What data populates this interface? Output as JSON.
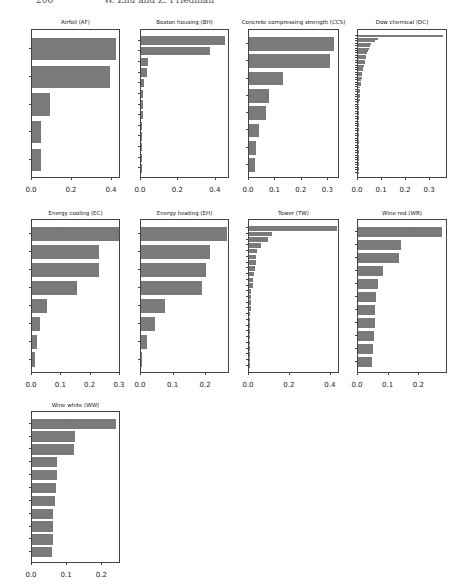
{
  "page_header": {
    "page_number": "206",
    "running_title": "W. Zhu and Z. Friedman"
  },
  "style": {
    "bar_color": "#7a7a7a",
    "axis_color": "#444444"
  },
  "chart_data": [
    {
      "id": "af",
      "type": "bar",
      "orientation": "horizontal",
      "title": "Airfoil (AF)",
      "categories": [
        "X5",
        "X1",
        "X3",
        "X4",
        "X2"
      ],
      "values": [
        0.42,
        0.39,
        0.09,
        0.045,
        0.043
      ],
      "xticks": [
        "0.0",
        "0.2",
        "0.4"
      ],
      "xlim": [
        0,
        0.44
      ]
    },
    {
      "id": "bh",
      "type": "bar",
      "orientation": "horizontal",
      "title": "Boston housing (BH)",
      "categories": [
        "X13",
        "X6",
        "X1",
        "X8",
        "X10",
        "X12",
        "X7",
        "X11",
        "X5",
        "X3",
        "X9",
        "X2",
        "X4"
      ],
      "values": [
        0.45,
        0.37,
        0.04,
        0.03,
        0.015,
        0.013,
        0.012,
        0.01,
        0.008,
        0.006,
        0.004,
        0.003,
        0.002
      ],
      "xticks": [
        "0.0",
        "0.2",
        "0.4"
      ],
      "xlim": [
        0,
        0.47
      ]
    },
    {
      "id": "ccs",
      "type": "bar",
      "orientation": "horizontal",
      "title": "Concrete compressing strength (CCS)",
      "categories": [
        "X8",
        "X1",
        "X4",
        "X5",
        "X2",
        "X7",
        "X6",
        "X3"
      ],
      "values": [
        0.32,
        0.305,
        0.13,
        0.075,
        0.065,
        0.037,
        0.028,
        0.023
      ],
      "xticks": [
        "0.0",
        "0.1",
        "0.2",
        "0.3"
      ],
      "xlim": [
        0,
        0.34
      ]
    },
    {
      "id": "dc",
      "type": "bar",
      "orientation": "horizontal",
      "title": "Dow chemical (DC)",
      "categories": [
        "X1",
        "X2",
        "X3",
        "X4",
        "X5",
        "X6",
        "X7",
        "X8",
        "X9",
        "X10",
        "X11",
        "X12",
        "X13",
        "X14",
        "X15",
        "X16",
        "X17",
        "X18",
        "X19",
        "X20",
        "X21",
        "X22",
        "X23",
        "X24",
        "X25",
        "X26",
        "X27",
        "X28",
        "X29",
        "X30",
        "X31",
        "X32",
        "X33",
        "X34",
        "X35",
        "X36",
        "X37",
        "X38",
        "X39",
        "X40",
        "X41",
        "X42",
        "X43",
        "X44",
        "X45",
        "X46",
        "X47",
        "X48",
        "X49",
        "X50",
        "X51",
        "X52",
        "X53",
        "X54",
        "X55",
        "X56",
        "X57"
      ],
      "values": [
        0.355,
        0.085,
        0.07,
        0.055,
        0.05,
        0.045,
        0.04,
        0.038,
        0.035,
        0.032,
        0.03,
        0.028,
        0.025,
        0.022,
        0.02,
        0.018,
        0.016,
        0.015,
        0.013,
        0.012,
        0.011,
        0.01,
        0.009,
        0.008,
        0.008,
        0.007,
        0.007,
        0.006,
        0.006,
        0.005,
        0.005,
        0.005,
        0.004,
        0.004,
        0.004,
        0.003,
        0.003,
        0.003,
        0.003,
        0.002,
        0.002,
        0.002,
        0.002,
        0.002,
        0.002,
        0.001,
        0.001,
        0.001,
        0.001,
        0.001,
        0.001,
        0.001,
        0.001,
        0.001,
        0.001,
        0.001,
        0.001
      ],
      "xticks": [
        "0.0",
        "0.1",
        "0.2",
        "0.3"
      ],
      "xlim": [
        0,
        0.37
      ]
    },
    {
      "id": "ec",
      "type": "bar",
      "orientation": "horizontal",
      "title": "Energy cooling (EC)",
      "categories": [
        "X1",
        "X4",
        "X5",
        "X2",
        "X7",
        "X3",
        "X8",
        "X6"
      ],
      "values": [
        0.295,
        0.23,
        0.228,
        0.155,
        0.05,
        0.028,
        0.018,
        0.01
      ],
      "xticks": [
        "0.0",
        "0.1",
        "0.2",
        "0.3"
      ],
      "xlim": [
        0,
        0.3
      ]
    },
    {
      "id": "eh",
      "type": "bar",
      "orientation": "horizontal",
      "title": "Energy heating (EH)",
      "categories": [
        "X2",
        "X5",
        "X1",
        "X4",
        "X7",
        "X3",
        "X8",
        "X6"
      ],
      "values": [
        0.265,
        0.213,
        0.198,
        0.188,
        0.073,
        0.042,
        0.018,
        0.001
      ],
      "xticks": [
        "0.0",
        "0.1",
        "0.2"
      ],
      "xlim": [
        0,
        0.27
      ]
    },
    {
      "id": "tw",
      "type": "bar",
      "orientation": "horizontal",
      "title": "Tower (TW)",
      "categories": [
        "X6",
        "X1",
        "X2",
        "X8",
        "X17",
        "X23",
        "X20",
        "X22",
        "X24",
        "X13",
        "X12",
        "X9",
        "X16",
        "X10",
        "X3",
        "X4",
        "X11",
        "X7",
        "X21",
        "X15",
        "X14",
        "X25",
        "X19",
        "X5",
        "X18"
      ],
      "values": [
        0.43,
        0.11,
        0.095,
        0.06,
        0.04,
        0.035,
        0.035,
        0.03,
        0.025,
        0.02,
        0.018,
        0.012,
        0.01,
        0.01,
        0.008,
        0.007,
        0.005,
        0.004,
        0.003,
        0.003,
        0.002,
        0.002,
        0.002,
        0.001,
        0.001
      ],
      "xticks": [
        "0.0",
        "0.2",
        "0.4"
      ],
      "xlim": [
        0,
        0.44
      ]
    },
    {
      "id": "wr",
      "type": "bar",
      "orientation": "horizontal",
      "title": "Wine red (WR)",
      "categories": [
        "X11",
        "X2",
        "X10",
        "X7",
        "X1",
        "X9",
        "X5",
        "X8",
        "X4",
        "X3",
        "X6"
      ],
      "values": [
        0.275,
        0.14,
        0.132,
        0.08,
        0.066,
        0.058,
        0.057,
        0.054,
        0.053,
        0.048,
        0.045
      ],
      "xticks": [
        "0.0",
        "0.1",
        "0.2"
      ],
      "xlim": [
        0,
        0.29
      ]
    },
    {
      "id": "ww",
      "type": "bar",
      "orientation": "horizontal",
      "title": "Wine white (WW)",
      "categories": [
        "X11",
        "X8",
        "X2",
        "X7",
        "X1",
        "X6",
        "X5",
        "X3",
        "X10",
        "X4",
        "X9"
      ],
      "values": [
        0.24,
        0.122,
        0.118,
        0.071,
        0.07,
        0.069,
        0.066,
        0.061,
        0.06,
        0.06,
        0.058
      ],
      "xticks": [
        "0.0",
        "0.1",
        "0.2"
      ],
      "xlim": [
        0,
        0.25
      ]
    }
  ],
  "layout": [
    {
      "title_y": 19,
      "ax": [
        31,
        29,
        89,
        149
      ],
      "xlab_y": 186
    },
    {
      "title_y": 19,
      "ax": [
        140,
        29,
        89,
        149
      ],
      "xlab_y": 186
    },
    {
      "title_y": 19,
      "ax": [
        248,
        29,
        91,
        149
      ],
      "xlab_y": 186
    },
    {
      "title_y": 19,
      "ax": [
        357,
        29,
        90,
        149
      ],
      "xlab_y": 186
    },
    {
      "title_y": 210,
      "ax": [
        31,
        219,
        89,
        154
      ],
      "xlab_y": 381
    },
    {
      "title_y": 210,
      "ax": [
        140,
        219,
        89,
        154
      ],
      "xlab_y": 381
    },
    {
      "title_y": 210,
      "ax": [
        248,
        219,
        91,
        154
      ],
      "xlab_y": 381
    },
    {
      "title_y": 210,
      "ax": [
        357,
        219,
        90,
        154
      ],
      "xlab_y": 381
    },
    {
      "title_y": 402,
      "ax": [
        31,
        411,
        89,
        152
      ],
      "xlab_y": 571
    }
  ]
}
